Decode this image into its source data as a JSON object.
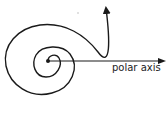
{
  "diagram": {
    "axis_label": "polar axis",
    "pole": {
      "x": 48,
      "y": 61
    },
    "colors": {
      "stroke": "#1a1a1a",
      "label": "#222222",
      "background": "#ffffff"
    }
  }
}
